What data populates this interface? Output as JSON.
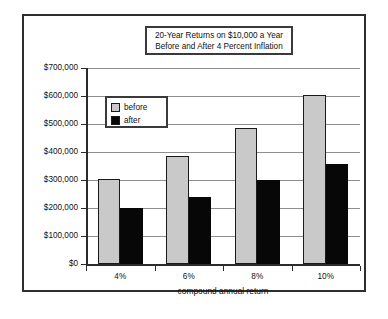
{
  "chart_data": {
    "type": "bar",
    "title": "20-Year Returns on $10,000 a Year Before and After 4 Percent Inflation",
    "title_lines": [
      "20-Year Returns on $10,000 a Year",
      "Before and After 4 Percent Inflation"
    ],
    "xlabel": "compound annual return",
    "ylabel": "",
    "categories": [
      "4%",
      "6%",
      "8%",
      "10%"
    ],
    "series": [
      {
        "name": "before",
        "color": "#c9c9c9",
        "values": [
          305000,
          385000,
          487000,
          605000
        ]
      },
      {
        "name": "after",
        "color": "#070707",
        "values": [
          200000,
          240000,
          300000,
          357000
        ]
      }
    ],
    "ylim": [
      0,
      700000
    ],
    "ytick_values": [
      700000,
      600000,
      500000,
      400000,
      300000,
      200000,
      100000,
      0
    ],
    "ytick_labels": [
      "$700,000",
      "$600,000",
      "$500,000",
      "$400,000",
      "$300,000",
      "$200,000",
      "$100,000",
      "$0"
    ],
    "grid": true,
    "legend_position": "upper-left-inside",
    "legend_entries": [
      "before",
      "after"
    ]
  },
  "frame": {
    "border_color": "#2e2e2e",
    "background": "#ffffff"
  }
}
